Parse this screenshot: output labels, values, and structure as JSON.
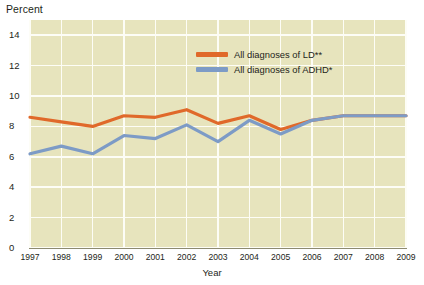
{
  "chart_data": {
    "type": "line",
    "title": "",
    "ylabel": "Percent",
    "xlabel": "Year",
    "x": [
      1997,
      1998,
      1999,
      2000,
      2001,
      2002,
      2003,
      2004,
      2005,
      2006,
      2007,
      2008,
      2009
    ],
    "categories": [
      "1997",
      "1998",
      "1999",
      "2000",
      "2001",
      "2002",
      "2003",
      "2004",
      "2005",
      "2006",
      "2007",
      "2008",
      "2009"
    ],
    "ylim": [
      0,
      15
    ],
    "yticks": [
      0,
      2,
      4,
      6,
      8,
      10,
      12,
      14
    ],
    "ytick_labels": [
      "0",
      "2",
      "4",
      "6",
      "8",
      "10",
      "12",
      "14"
    ],
    "grid": true,
    "legend_position": "upper-center",
    "series": [
      {
        "name": "All diagnoses of LD**",
        "color": "#e0692a",
        "values": [
          8.6,
          8.3,
          8.0,
          8.7,
          8.6,
          9.1,
          8.2,
          8.7,
          7.8,
          8.4,
          8.7,
          8.7,
          8.7
        ]
      },
      {
        "name": "All diagnoses of ADHD*",
        "color": "#7d9bc6",
        "values": [
          6.2,
          6.7,
          6.2,
          7.4,
          7.2,
          8.1,
          7.0,
          8.4,
          7.5,
          8.4,
          8.7,
          8.7,
          8.7
        ]
      }
    ]
  },
  "axes": {
    "y_title": "Percent",
    "x_title": "Year"
  },
  "legend": {
    "entries": [
      {
        "label": "All diagnoses of LD**",
        "color": "#e0692a"
      },
      {
        "label": "All diagnoses of ADHD*",
        "color": "#7d9bc6"
      }
    ]
  },
  "colors": {
    "plot_background": "#e7e4bd",
    "gridline": "#fdfdf6",
    "axis": "#8d8a70",
    "text": "#231f20",
    "ld_line": "#e0692a",
    "adhd_line": "#7d9bc6"
  }
}
